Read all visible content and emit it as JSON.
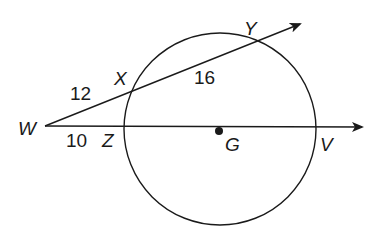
{
  "diagram": {
    "type": "circle-secants",
    "colors": {
      "stroke": "#1a1a1a",
      "background": "#ffffff"
    },
    "circle": {
      "center_label": "G"
    },
    "points": {
      "W": "W",
      "X": "X",
      "Y": "Y",
      "Z": "Z",
      "V": "V",
      "G": "G"
    },
    "segments": {
      "WX": "12",
      "XY": "16",
      "WZ": "10"
    },
    "rays": [
      {
        "name": "ray-WY",
        "from": "W",
        "through": [
          "X",
          "Y"
        ]
      },
      {
        "name": "ray-WV",
        "from": "W",
        "through": [
          "Z",
          "V"
        ]
      }
    ]
  }
}
